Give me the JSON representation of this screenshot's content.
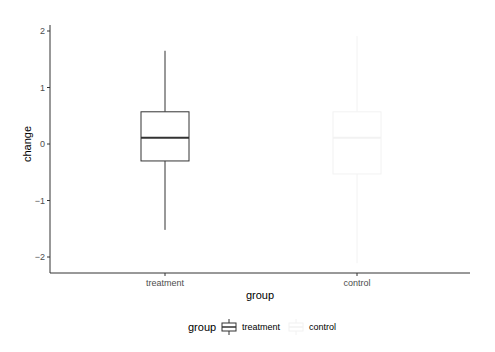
{
  "chart_data": {
    "type": "boxplot",
    "title": "",
    "xlabel": "group",
    "ylabel": "change",
    "ylim": [
      -2.3,
      2.1
    ],
    "yticks": [
      -2,
      -1,
      0,
      1,
      2
    ],
    "ytick_labels": [
      "−2",
      "−1",
      "0",
      "1",
      "2"
    ],
    "categories": [
      "treatment",
      "control"
    ],
    "grid": false,
    "boxes": [
      {
        "group": "treatment",
        "whisker_low": -1.52,
        "q1": -0.3,
        "median": 0.11,
        "q3": 0.57,
        "whisker_high": 1.65,
        "color": "#333333"
      },
      {
        "group": "control",
        "whisker_low": -2.11,
        "q1": -0.53,
        "median": 0.11,
        "q3": 0.57,
        "whisker_high": 1.91,
        "color": "#f2f2f2"
      }
    ],
    "legend": {
      "title": "group",
      "position": "bottom",
      "entries": [
        {
          "label": "treatment",
          "color": "#333333"
        },
        {
          "label": "control",
          "color": "#f2f2f2"
        }
      ]
    }
  }
}
